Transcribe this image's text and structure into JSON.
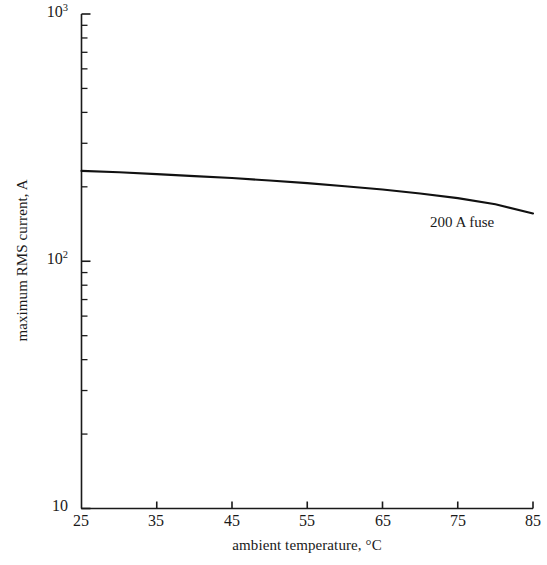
{
  "chart_data": {
    "type": "line",
    "title": "",
    "subtitle": "",
    "xlabel": "ambient temperature, °C",
    "ylabel": "maximum RMS current, A",
    "xscale": "linear",
    "yscale": "log",
    "xlim": [
      25,
      85
    ],
    "ylim": [
      10,
      1000
    ],
    "grid": false,
    "legend": "none",
    "x_ticks": [
      25,
      35,
      45,
      55,
      65,
      75,
      85
    ],
    "x_tick_labels": [
      "25",
      "35",
      "45",
      "55",
      "65",
      "75",
      "85"
    ],
    "y_major_ticks": [
      10,
      100,
      1000
    ],
    "y_major_tick_labels": [
      "10",
      "10²",
      "10³"
    ],
    "y_major_tick_mantissa": [
      "10",
      "10",
      "10"
    ],
    "y_major_tick_exponent": [
      "",
      "2",
      "3"
    ],
    "y_minor_ticks": [
      20,
      30,
      40,
      50,
      60,
      70,
      80,
      90,
      200,
      300,
      400,
      500,
      600,
      700,
      800,
      900
    ],
    "series": [
      {
        "name": "200 A fuse",
        "annotation": "200 A fuse",
        "x": [
          25,
          30,
          35,
          40,
          45,
          50,
          55,
          60,
          65,
          70,
          75,
          80,
          85
        ],
        "values": [
          232,
          229,
          225,
          221,
          217,
          212,
          207,
          201,
          195,
          188,
          180,
          170,
          156
        ]
      }
    ],
    "annotations": [
      {
        "text": "200 A fuse",
        "x": 72,
        "y": 128
      }
    ],
    "colors": {
      "axis": "#1a1a1a",
      "curve": "#111111",
      "background": "#ffffff",
      "text": "#1a1a1a"
    }
  }
}
